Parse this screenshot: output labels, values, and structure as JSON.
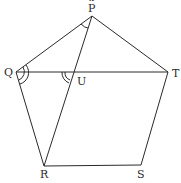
{
  "diagram": {
    "type": "geometry",
    "stroke_color": "#2a2a2a",
    "points": {
      "P": {
        "label": "P",
        "x": 92,
        "y": 16
      },
      "Q": {
        "label": "Q",
        "x": 16,
        "y": 72
      },
      "T": {
        "label": "T",
        "x": 168,
        "y": 72
      },
      "U": {
        "label": "U",
        "x": 73,
        "y": 72
      },
      "R": {
        "label": "R",
        "x": 44,
        "y": 166
      },
      "S": {
        "label": "S",
        "x": 141,
        "y": 165
      }
    },
    "top_mark": "x",
    "segments": [
      "PQ",
      "PT",
      "QT",
      "QR",
      "RS",
      "ST",
      "PR"
    ],
    "angle_marks": [
      {
        "vertex": "P",
        "arcs": 1,
        "between": [
          "Q",
          "R"
        ]
      },
      {
        "vertex": "Q",
        "arcs": 2,
        "between": [
          "P",
          "R"
        ]
      },
      {
        "vertex": "U",
        "arcs": 2,
        "between": [
          "Q",
          "R"
        ]
      }
    ]
  }
}
